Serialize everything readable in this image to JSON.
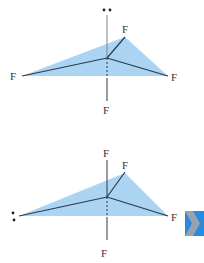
{
  "colors": {
    "plane_fill": "#9ccbf0",
    "bond": "#2a3a4a",
    "arrow_blue": "#2a8ae0",
    "arrow_gray": "#9aa3ab"
  },
  "molecule_top": {
    "lone_pair": "••",
    "atoms": [
      {
        "label": "F",
        "position": "axial-bottom"
      },
      {
        "label": "F",
        "position": "equatorial-left"
      },
      {
        "label": "F",
        "position": "equatorial-right"
      },
      {
        "label": "F",
        "position": "equatorial-back"
      }
    ],
    "top_label": "••",
    "left_label": "F",
    "right_label": "F",
    "back_label": "F",
    "bottom_label": "F"
  },
  "molecule_bottom": {
    "lone_pair": ":",
    "top_label": "F",
    "back_label": "F",
    "right_label": "F",
    "bottom_label": "F",
    "left_label": ":"
  },
  "next_icon": "chevron-right-icon"
}
